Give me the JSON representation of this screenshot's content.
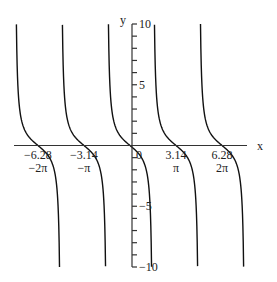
{
  "chart_data": {
    "type": "line",
    "title": "",
    "function": "y = -tan(x)",
    "xlabel": "x",
    "ylabel": "y",
    "xlim": [
      -7.7,
      8.0
    ],
    "ylim": [
      -10,
      10
    ],
    "grid": false,
    "legend": null,
    "x_ticks": [
      {
        "value": -6.28,
        "label": "-6.28",
        "sublabel": "-2π"
      },
      {
        "value": -3.14,
        "label": "-3.14",
        "sublabel": "-π"
      },
      {
        "value": 0,
        "label": "0",
        "sublabel": ""
      },
      {
        "value": 3.14,
        "label": "3.14",
        "sublabel": "π"
      },
      {
        "value": 6.28,
        "label": "6.28",
        "sublabel": "2π"
      }
    ],
    "y_ticks": [
      {
        "value": 10,
        "label": "10"
      },
      {
        "value": 5,
        "label": "5"
      },
      {
        "value": -5,
        "label": "-5"
      },
      {
        "value": -10,
        "label": "-10"
      }
    ],
    "y_minor_step": 1,
    "zeros": [
      -6.28,
      -3.14,
      0,
      3.14,
      6.28
    ],
    "asymptotes": [
      -7.85,
      -4.71,
      -1.57,
      1.57,
      4.71,
      7.85
    ],
    "series": [
      {
        "name": "branch -2π",
        "x_range": [
          -7.754,
          -4.812
        ]
      },
      {
        "name": "branch -π",
        "x_range": [
          -4.612,
          -1.671
        ]
      },
      {
        "name": "branch 0",
        "x_range": [
          -1.471,
          1.471
        ]
      },
      {
        "name": "branch π",
        "x_range": [
          1.671,
          4.612
        ]
      },
      {
        "name": "branch 2π",
        "x_range": [
          4.812,
          7.754
        ]
      }
    ]
  },
  "axes": {
    "x_label": "x",
    "y_label": "y"
  }
}
